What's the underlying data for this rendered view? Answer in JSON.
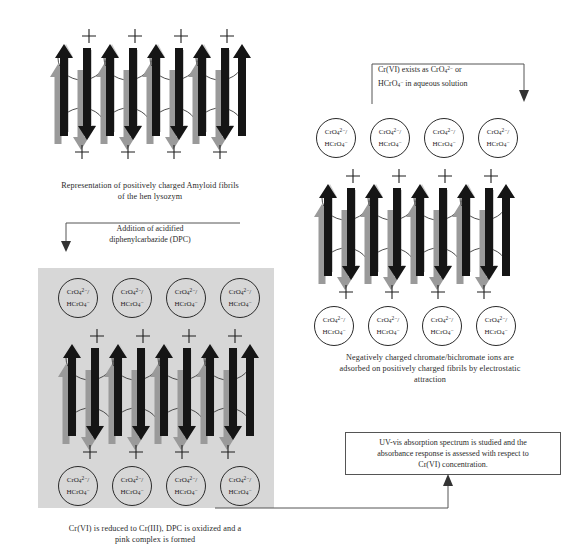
{
  "figure": {
    "type": "scheme-diagram"
  },
  "panels": {
    "top_left": {
      "name": "amyloid-fibrils-panel",
      "caption_line1": "Representation of positively charged Amyloid fibrils",
      "caption_line2": "of the hen lysozym",
      "charge_symbol": "+",
      "charges_top": 4,
      "charges_bottom": 4
    },
    "top_right": {
      "name": "adsorbed-ions-panel",
      "caption_line1": "Negatively charged chromate/bichromate ions are",
      "caption_line2": "adsorbed on positively charged fibrils by electrostatic",
      "caption_line3": "attraction",
      "charge_symbol": "+"
    },
    "bottom_left": {
      "name": "reduced-complex-panel",
      "caption_line1": "Cr(VI) is reduced to Cr(III), DPC is oxidized and a",
      "caption_line2": "pink complex is formed",
      "charge_symbol": "+",
      "background_color": "#d7d7d7"
    }
  },
  "ion_label": {
    "top_formula_prefix": "CrO",
    "top_formula_sub": "4",
    "top_formula_sup": "2−",
    "top_formula_suffix": "/",
    "bottom_formula_prefix": "HCrO",
    "bottom_formula_sub": "4",
    "bottom_formula_sup": "−"
  },
  "annotations": {
    "cr6_species": {
      "name": "cr6-species-note",
      "line1": "Cr(VI) exists as  CrO₄²⁻ or",
      "line2": "HCrO₄⁻ in aqueous solution",
      "line1_a": "Cr(VI) exists as  CrO",
      "line1_sub": "4",
      "line1_sup": "2−",
      "line1_b": " or",
      "line2_a": "HCrO",
      "line2_sub": "4",
      "line2_sup": "−",
      "line2_b": " in aqueous solution"
    },
    "dpc_addition": {
      "name": "dpc-addition-note",
      "line1": "Addition of acidified",
      "line2": "diphenylcarbazide  (DPC)"
    },
    "uvvis_box": {
      "name": "uv-vis-measurement-box",
      "line1": "UV-vis absorption spectrum is studied and the",
      "line2": "absorbance response is assessed with respect to",
      "line3": "Cr(VI) concentration."
    }
  },
  "colors": {
    "arrow_dark": "#151515",
    "arrow_gray": "#9a9a9a",
    "arrow_pale": "#c9c9c9",
    "panel_gray": "#d7d7d7",
    "line": "#555555",
    "text": "#2b2b2b"
  }
}
